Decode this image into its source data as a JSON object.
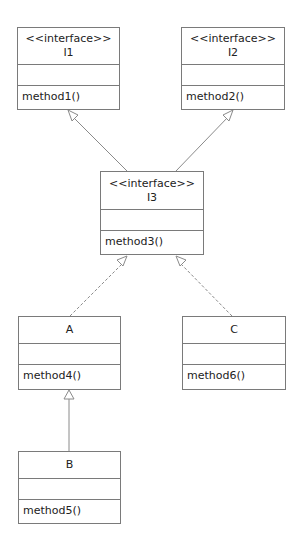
{
  "diagram": {
    "type": "UML class diagram",
    "classes": {
      "I1": {
        "stereotype": "<<interface>>",
        "name": "I1",
        "methods": [
          "method1()"
        ]
      },
      "I2": {
        "stereotype": "<<interface>>",
        "name": "I2",
        "methods": [
          "method2()"
        ]
      },
      "I3": {
        "stereotype": "<<interface>>",
        "name": "I3",
        "methods": [
          "method3()"
        ]
      },
      "A": {
        "name": "A",
        "methods": [
          "method4()"
        ]
      },
      "C": {
        "name": "C",
        "methods": [
          "method6()"
        ]
      },
      "B": {
        "name": "B",
        "methods": [
          "method5()"
        ]
      }
    },
    "relationships": [
      {
        "from": "I3",
        "to": "I1",
        "kind": "generalization",
        "line": "solid"
      },
      {
        "from": "I3",
        "to": "I2",
        "kind": "generalization",
        "line": "solid"
      },
      {
        "from": "A",
        "to": "I3",
        "kind": "realization",
        "line": "dashed"
      },
      {
        "from": "C",
        "to": "I3",
        "kind": "realization",
        "line": "dashed"
      },
      {
        "from": "B",
        "to": "A",
        "kind": "generalization",
        "line": "solid"
      }
    ]
  }
}
